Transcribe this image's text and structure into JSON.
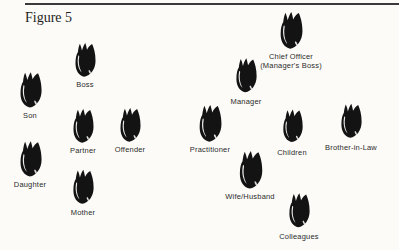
{
  "figure": {
    "title": "Figure 5",
    "items": [
      {
        "label": "Son"
      },
      {
        "label": "Boss"
      },
      {
        "label": "Partner"
      },
      {
        "label": "Offender"
      },
      {
        "label": "Daughter"
      },
      {
        "label": "Mother"
      },
      {
        "label": "Manager"
      },
      {
        "label": "Chief Officer\n(Manager's Boss)"
      },
      {
        "label": "Practitioner"
      },
      {
        "label": "Children"
      },
      {
        "label": "Brother-in-Law"
      },
      {
        "label": "Wife/Husband"
      },
      {
        "label": "Colleagues"
      }
    ],
    "colors": {
      "background": "#fcfbf8",
      "blob": "#131313",
      "text": "#2b2b2b",
      "rule": "#3a3a3a"
    }
  }
}
